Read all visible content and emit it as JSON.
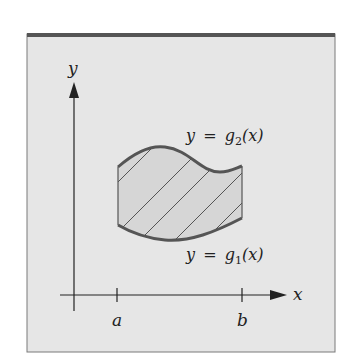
{
  "figure": {
    "axes": {
      "x_label": "x",
      "y_label": "y",
      "tick_a": "a",
      "tick_b": "b"
    },
    "curves": {
      "upper": {
        "lhs": "y",
        "eq": "=",
        "func": "g",
        "sub": "2",
        "arg": "(x)"
      },
      "lower": {
        "lhs": "y",
        "eq": "=",
        "func": "g",
        "sub": "1",
        "arg": "(x)"
      }
    },
    "colors": {
      "page_bg": "#ffffff",
      "frame_bg": "#e6e6e6",
      "frame_top_border": "#555555",
      "frame_border": "#7a7a7a",
      "region_fill": "#d6d6d6",
      "curve_stroke": "#555555",
      "axis_stroke": "#222222",
      "hatch_stroke": "#555555"
    }
  }
}
